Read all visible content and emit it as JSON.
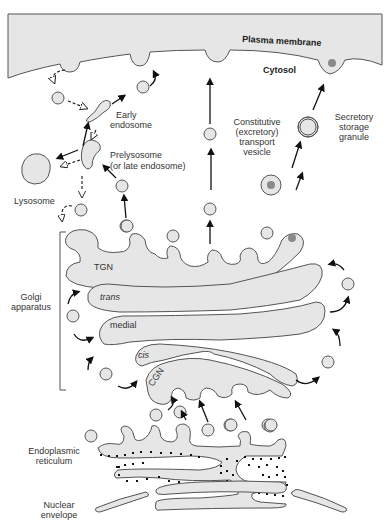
{
  "diagram": {
    "labels": {
      "plasma_membrane": "Plasma membrane",
      "cytosol": "Cytosol",
      "early_endosome_1": "Early",
      "early_endosome_2": "endosome",
      "prelysosome_1": "Prelysosome",
      "prelysosome_2": "(or late endosome)",
      "lysosome": "Lysosome",
      "constitutive_1": "Constitutive",
      "constitutive_2": "(excretory)",
      "constitutive_3": "transport",
      "constitutive_4": "vesicle",
      "secretory_1": "Secretory",
      "secretory_2": "storage",
      "secretory_3": "granule",
      "golgi_1": "Golgi",
      "golgi_2": "apparatus",
      "tgn": "TGN",
      "trans": "trans",
      "medial": "medial",
      "cis": "cis",
      "cgn": "CGN",
      "er_1": "Endoplasmic",
      "er_2": "reticulum",
      "nuclear_1": "Nuclear",
      "nuclear_2": "envelope"
    },
    "colors": {
      "membrane_fill": "#e6e6e6",
      "outline": "#555555",
      "arrow": "#111111",
      "cargo": "#8a8a8a"
    }
  }
}
